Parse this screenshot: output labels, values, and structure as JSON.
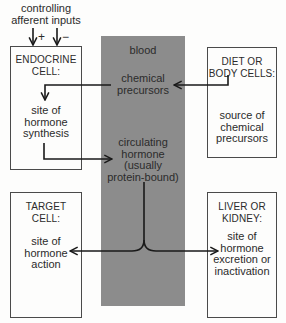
{
  "inputs": {
    "label_line1": "controlling",
    "label_line2": "afferent inputs",
    "plus": "+",
    "minus": "−"
  },
  "blood": {
    "label": "blood",
    "precursors_line1": "chemical",
    "precursors_line2": "precursors",
    "circulating_line1": "circulating",
    "circulating_line2": "hormone",
    "circulating_line3": "(usually",
    "circulating_line4": "protein-bound)"
  },
  "endocrine_cell": {
    "title_line1": "ENDOCRINE",
    "title_line2": "CELL:",
    "body_line1": "site of",
    "body_line2": "hormone",
    "body_line3": "synthesis"
  },
  "diet_cells": {
    "title_line1": "DIET OR",
    "title_line2": "BODY CELLS:",
    "body_line1": "source of",
    "body_line2": "chemical",
    "body_line3": "precursors"
  },
  "target_cell": {
    "title_line1": "TARGET",
    "title_line2": "CELL:",
    "body_line1": "site of",
    "body_line2": "hormone",
    "body_line3": "action"
  },
  "liver_kidney": {
    "title_line1": "LIVER OR",
    "title_line2": "KIDNEY:",
    "body_line1": "site of",
    "body_line2": "hormone",
    "body_line3": "excretion or",
    "body_line4": "inactivation"
  },
  "colors": {
    "blood_column": "#8c8c8c",
    "lines": "#1a1a1a",
    "box_border": "#4a4a4a",
    "background": "#fdfdfc"
  }
}
